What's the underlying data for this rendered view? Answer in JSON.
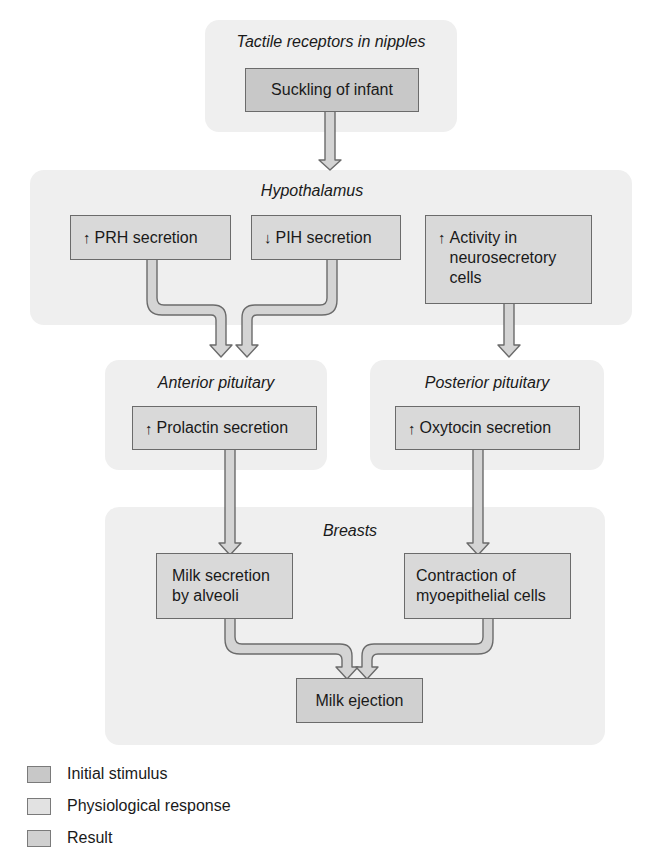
{
  "diagram": {
    "colors": {
      "panel_bg": "#efefef",
      "initial_stimulus": "#c8c8c8",
      "physiological_response": "#d9d9d9",
      "result": "#d0d0d0",
      "border": "#6b6b6b",
      "arrow_fill": "#d4d4d4"
    },
    "panels": {
      "tactile": {
        "title": "Tactile receptors in nipples"
      },
      "hypothalamus": {
        "title": "Hypothalamus"
      },
      "anterior": {
        "title": "Anterior pituitary"
      },
      "posterior": {
        "title": "Posterior pituitary"
      },
      "breasts": {
        "title": "Breasts"
      }
    },
    "nodes": {
      "suckling": {
        "text": "Suckling of infant",
        "type": "initial_stimulus"
      },
      "prh": {
        "indicator": "↑",
        "text": "PRH secretion",
        "type": "physiological_response"
      },
      "pih": {
        "indicator": "↓",
        "text": "PIH secretion",
        "type": "physiological_response"
      },
      "neuro": {
        "indicator": "↑",
        "text": "Activity in\nneurosecretory\ncells",
        "type": "physiological_response"
      },
      "prolactin": {
        "indicator": "↑",
        "text": "Prolactin secretion",
        "type": "physiological_response"
      },
      "oxytocin": {
        "indicator": "↑",
        "text": "Oxytocin secretion",
        "type": "physiological_response"
      },
      "milk_secretion": {
        "text": "Milk secretion\nby alveoli",
        "type": "physiological_response"
      },
      "contraction": {
        "text": "Contraction of\nmyoepithelial cells",
        "type": "physiological_response"
      },
      "milk_ejection": {
        "text": "Milk ejection",
        "type": "result"
      }
    },
    "edges": [
      {
        "from": "suckling",
        "to": "hypothalamus"
      },
      {
        "from": "prh",
        "to": "anterior_pituitary"
      },
      {
        "from": "pih",
        "to": "anterior_pituitary"
      },
      {
        "from": "neuro",
        "to": "posterior_pituitary"
      },
      {
        "from": "prolactin",
        "to": "milk_secretion"
      },
      {
        "from": "oxytocin",
        "to": "contraction"
      },
      {
        "from": "milk_secretion",
        "to": "milk_ejection"
      },
      {
        "from": "contraction",
        "to": "milk_ejection"
      }
    ]
  },
  "legend": {
    "items": [
      {
        "label": "Initial stimulus",
        "color": "#c8c8c8"
      },
      {
        "label": "Physiological response",
        "color": "#d9d9d9"
      },
      {
        "label": "Result",
        "color": "#d0d0d0"
      }
    ]
  }
}
